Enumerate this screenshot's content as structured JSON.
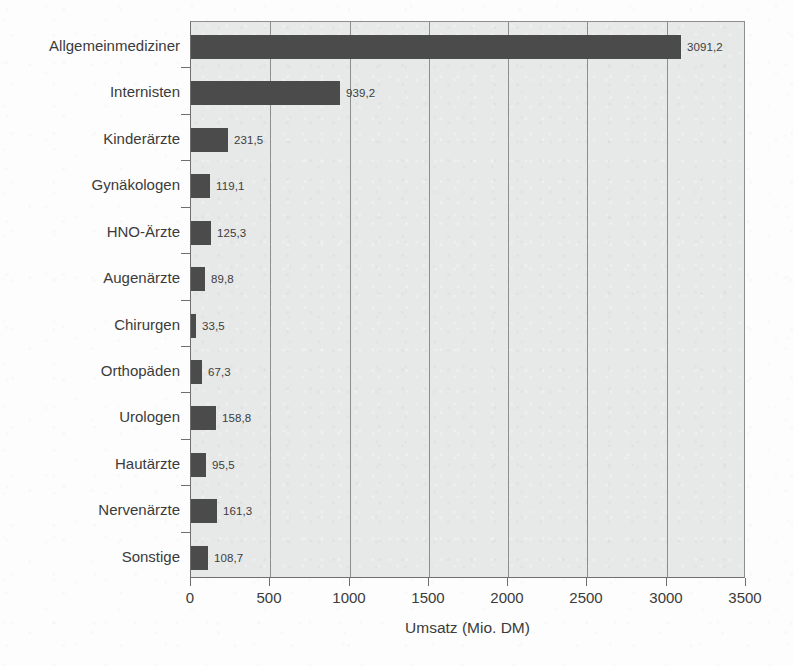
{
  "chart_data": {
    "type": "bar",
    "orientation": "horizontal",
    "title": "",
    "subtitle": "",
    "xlabel": "Umsatz (Mio. DM)",
    "ylabel": "",
    "xlim": [
      0,
      3500
    ],
    "xticks": [
      "0",
      "500",
      "1000",
      "1500",
      "2000",
      "2500",
      "3000",
      "3500"
    ],
    "xtick_values": [
      0,
      500,
      1000,
      1500,
      2000,
      2500,
      3000,
      3500
    ],
    "grid": "vertical",
    "legend": "none",
    "categories": [
      "Allgemeinmediziner",
      "Internisten",
      "Kinderärzte",
      "Gynäkologen",
      "HNO-Ärzte",
      "Augenärzte",
      "Chirurgen",
      "Orthopäden",
      "Urologen",
      "Hautärzte",
      "Nervenärzte",
      "Sonstige"
    ],
    "values": [
      3091.2,
      939.2,
      231.5,
      119.1,
      125.3,
      89.8,
      33.5,
      67.3,
      158.8,
      95.5,
      161.3,
      108.7
    ],
    "value_labels": [
      "3091,2",
      "939,2",
      "231,5",
      "119,1",
      "125,3",
      "89,8",
      "33,5",
      "67,3",
      "158,8",
      "95,5",
      "161,3",
      "108,7"
    ],
    "colors": {
      "bar": "#4b4b4b",
      "plot_background": "#e7e8e8",
      "page_background": "#fdfdfd",
      "gridline": "#8d8d8d",
      "axis": "#6f6f6f",
      "text": "#3b3b3b"
    }
  }
}
